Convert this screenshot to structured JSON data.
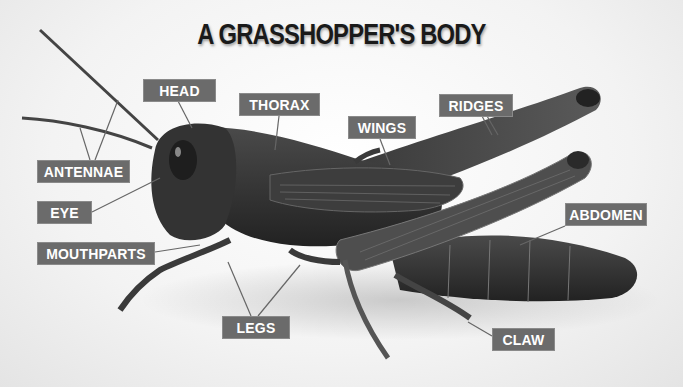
{
  "title": "A GRASSHOPPER'S BODY",
  "labels": {
    "head": "HEAD",
    "thorax": "THORAX",
    "wings": "WINGS",
    "ridges": "RIDGES",
    "antennae": "ANTENNAE",
    "eye": "EYE",
    "mouthparts": "MOUTHPARTS",
    "abdomen": "ABDOMEN",
    "legs": "LEGS",
    "claw": "CLAW"
  },
  "colors": {
    "label_bg": "#6b6b6b",
    "label_text": "#ffffff",
    "title": "#1a1a1a",
    "insect_dark": "#2c2c2c",
    "insect_mid": "#4a4a4a"
  }
}
